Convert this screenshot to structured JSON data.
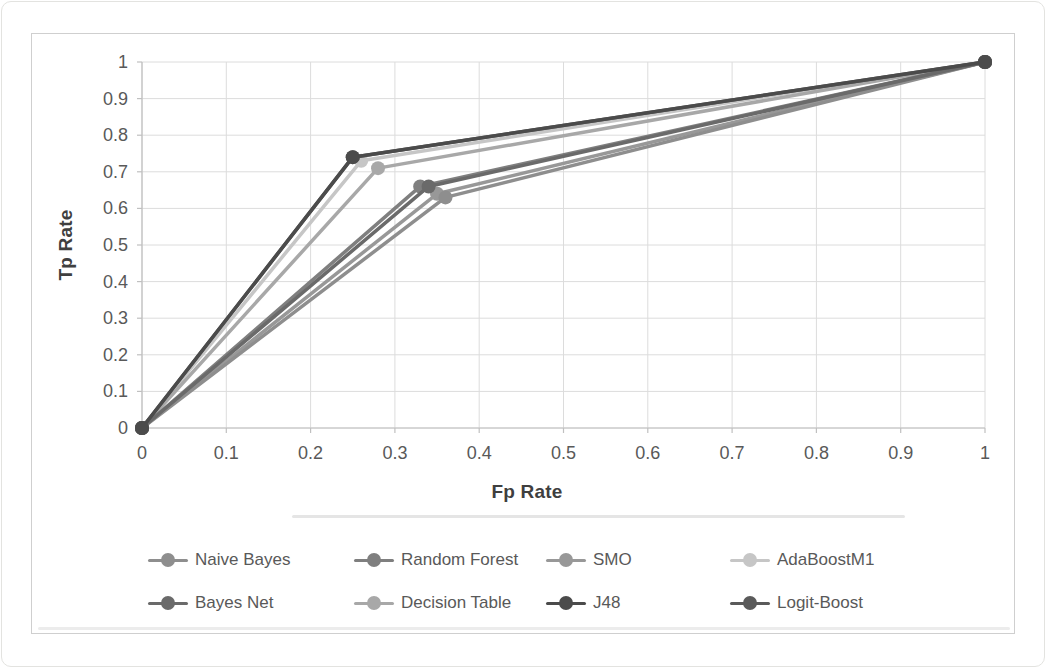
{
  "figure": {
    "background_color": "#ffffff",
    "frame_border_color": "#cfcfcf"
  },
  "chart_data": {
    "type": "line",
    "title": "",
    "xlabel": "Fp Rate",
    "ylabel": "Tp Rate",
    "xlim": [
      0,
      1
    ],
    "ylim": [
      0,
      1
    ],
    "grid": true,
    "legend_position": "bottom",
    "gridline_color": "#dcdcdc",
    "axis_line_color": "#c0c0c0",
    "tick_label_color": "#595959",
    "axis_title_color": "#3f3f3f",
    "xticks": {
      "values": [
        0,
        0.1,
        0.2,
        0.3,
        0.4,
        0.5,
        0.6,
        0.7,
        0.8,
        0.9,
        1
      ],
      "labels": [
        "0",
        "0.1",
        "0.2",
        "0.3",
        "0.4",
        "0.5",
        "0.6",
        "0.7",
        "0.8",
        "0.9",
        "1"
      ]
    },
    "yticks": {
      "values": [
        0,
        0.1,
        0.2,
        0.3,
        0.4,
        0.5,
        0.6,
        0.7,
        0.8,
        0.9,
        1
      ],
      "labels": [
        "0",
        "0.1",
        "0.2",
        "0.3",
        "0.4",
        "0.5",
        "0.6",
        "0.7",
        "0.8",
        "0.9",
        "1"
      ]
    },
    "series": [
      {
        "name": "Naive Bayes",
        "color": "#8e8e8e",
        "points": [
          [
            0,
            0
          ],
          [
            0.36,
            0.63
          ],
          [
            1,
            1
          ]
        ]
      },
      {
        "name": "Random Forest",
        "color": "#7f7f7f",
        "points": [
          [
            0,
            0
          ],
          [
            0.33,
            0.66
          ],
          [
            1,
            1
          ]
        ]
      },
      {
        "name": "SMO",
        "color": "#989898",
        "points": [
          [
            0,
            0
          ],
          [
            0.35,
            0.64
          ],
          [
            1,
            1
          ]
        ]
      },
      {
        "name": "AdaBoostM1",
        "color": "#c6c6c6",
        "points": [
          [
            0,
            0
          ],
          [
            0.26,
            0.73
          ],
          [
            1,
            1
          ]
        ]
      },
      {
        "name": "Bayes Net",
        "color": "#6a6a6a",
        "points": [
          [
            0,
            0
          ],
          [
            0.34,
            0.66
          ],
          [
            1,
            1
          ]
        ]
      },
      {
        "name": "Decision Table",
        "color": "#a8a8a8",
        "points": [
          [
            0,
            0
          ],
          [
            0.28,
            0.71
          ],
          [
            1,
            1
          ]
        ]
      },
      {
        "name": "J48",
        "color": "#4b4b4b",
        "points": [
          [
            0,
            0
          ],
          [
            0.25,
            0.74
          ],
          [
            1,
            1
          ]
        ]
      },
      {
        "name": "Logit-Boost",
        "color": "#5a5a5a",
        "points": [
          [
            0,
            0
          ],
          [
            0.25,
            0.74
          ],
          [
            1,
            1
          ]
        ]
      }
    ]
  }
}
